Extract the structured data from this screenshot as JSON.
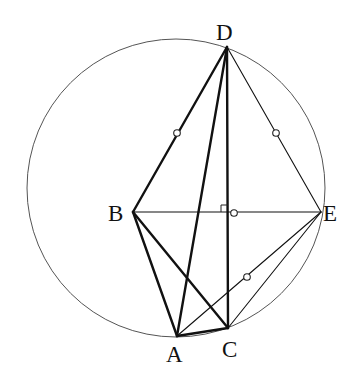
{
  "diagram": {
    "type": "geometry",
    "circle": {
      "cx": 176,
      "cy": 188,
      "r": 149
    },
    "points": {
      "D": {
        "x": 227,
        "y": 47,
        "label": "D",
        "lx": 216,
        "ly": 40
      },
      "B": {
        "x": 133,
        "y": 212,
        "label": "B",
        "lx": 108,
        "ly": 221
      },
      "E": {
        "x": 321,
        "y": 212,
        "label": "E",
        "lx": 323,
        "ly": 221
      },
      "A": {
        "x": 177,
        "y": 336,
        "label": "A",
        "lx": 166,
        "ly": 362
      },
      "C": {
        "x": 228,
        "y": 328,
        "label": "C",
        "lx": 222,
        "ly": 357
      }
    },
    "segments": [
      {
        "from": "D",
        "to": "B",
        "weight": "thick"
      },
      {
        "from": "D",
        "to": "A",
        "weight": "thick"
      },
      {
        "from": "D",
        "to": "C",
        "weight": "thick"
      },
      {
        "from": "D",
        "to": "E",
        "weight": "thin"
      },
      {
        "from": "B",
        "to": "E",
        "weight": "thin"
      },
      {
        "from": "B",
        "to": "A",
        "weight": "thick"
      },
      {
        "from": "B",
        "to": "C",
        "weight": "thick"
      },
      {
        "from": "A",
        "to": "C",
        "weight": "thick"
      },
      {
        "from": "A",
        "to": "E",
        "weight": "thin"
      },
      {
        "from": "C",
        "to": "E",
        "weight": "thin"
      }
    ],
    "equal_marks": [
      {
        "x": 177,
        "y": 133,
        "on": "DB"
      },
      {
        "x": 276,
        "y": 133,
        "on": "DE"
      },
      {
        "x": 234,
        "y": 213,
        "on": "BE"
      },
      {
        "x": 247,
        "y": 277,
        "on": "AE"
      }
    ],
    "right_angle": {
      "x": 228,
      "y": 212,
      "size": 7,
      "between": [
        "DC",
        "BE"
      ]
    },
    "labels": [
      "D",
      "B",
      "E",
      "A",
      "C"
    ]
  }
}
